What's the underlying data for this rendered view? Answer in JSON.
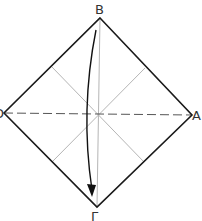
{
  "diagram": {
    "type": "origami-fold-step",
    "labels": {
      "top": "B",
      "right": "A",
      "bottom": "Γ",
      "left": "D"
    },
    "vertices": {
      "B": [
        100,
        18
      ],
      "A": [
        192,
        115
      ],
      "G": [
        97,
        207
      ],
      "D": [
        4,
        113
      ]
    },
    "center": [
      98,
      114
    ],
    "midpoints": {
      "upper_left": [
        52,
        67
      ],
      "upper_right": [
        145,
        68
      ],
      "lower_left": [
        52,
        162
      ],
      "lower_right": [
        144,
        162
      ]
    },
    "arrow": {
      "from": "B",
      "to": "Γ",
      "description": "curved fold arrow from top vertex to bottom vertex"
    },
    "colors": {
      "outline": "#1a1a1a",
      "crease": "#b5b5b5",
      "dashed": "#555555",
      "arrow": "#111111"
    }
  }
}
